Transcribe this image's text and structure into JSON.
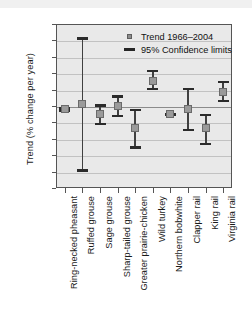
{
  "chart_data": {
    "type": "scatter",
    "title": "",
    "xlabel": "",
    "ylabel": "Trend (% change per year)",
    "ylim": [
      -25,
      25
    ],
    "yticks": [
      25,
      20,
      15,
      10,
      5,
      0,
      -5,
      -10,
      -15,
      -20,
      -25
    ],
    "ytick_labels": [
      "25",
      "20",
      "15",
      "10",
      "5",
      "0",
      "−5",
      "−10",
      "−15",
      "−20",
      "−25"
    ],
    "grid": true,
    "legend_position": "top-right",
    "legend": [
      {
        "label": "Trend 1966–2004",
        "marker": "square"
      },
      {
        "label": "95% Confidence limits",
        "marker": "line"
      }
    ],
    "categories": [
      "Ring-necked pheasant",
      "Ruffed grouse",
      "Sage grouse",
      "Sharp-tailed grouse",
      "Greater prairie-chicken",
      "Wild turkey",
      "Northern bobwhite",
      "Clapper rail",
      "King rail",
      "Virginia rail"
    ],
    "series": [
      {
        "name": "Trend 1966–2004",
        "values": [
          -1.0,
          0.5,
          -2.5,
          -0.1,
          -6.8,
          7.7,
          -2.5,
          -1.0,
          -6.8,
          4.2
        ]
      },
      {
        "name": "95% Confidence limits upper",
        "values": [
          -0.4,
          21.0,
          0.5,
          3.3,
          -0.9,
          11.0,
          -2.1,
          5.6,
          -2.3,
          7.7
        ]
      },
      {
        "name": "95% Confidence limits lower",
        "values": [
          -1.7,
          -20.0,
          -5.8,
          -3.5,
          -13.0,
          4.8,
          -2.9,
          -7.6,
          -12.0,
          1.2
        ]
      }
    ]
  }
}
